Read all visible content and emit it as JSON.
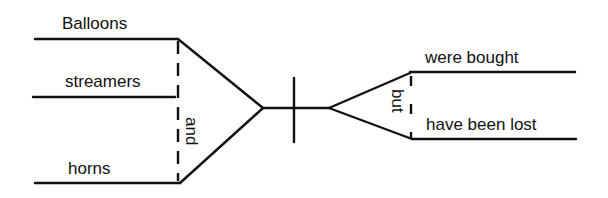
{
  "diagram": {
    "type": "sentence-diagram",
    "subjects": [
      "Balloons",
      "streamers",
      "horns"
    ],
    "subject_conjunction": "and",
    "predicates": [
      "were bought",
      "have been lost"
    ],
    "predicate_conjunction": "but",
    "line_color": "#111111"
  }
}
